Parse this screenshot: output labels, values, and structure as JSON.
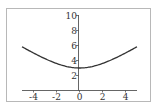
{
  "chart_data": {
    "type": "line",
    "title": "",
    "xlabel": "",
    "ylabel": "",
    "xlim": [
      -5,
      5
    ],
    "ylim": [
      0,
      10
    ],
    "grid": false,
    "legend": null,
    "x_ticks": [
      "-4",
      "-2",
      "0",
      "2",
      "4"
    ],
    "y_ticks": [
      "2",
      "4",
      "6",
      "8",
      "10"
    ],
    "series": [
      {
        "name": "curve",
        "function": "sqrt(x^2 + 9)",
        "x": [
          -5,
          -4,
          -3,
          -2,
          -1,
          0,
          1,
          2,
          3,
          4,
          5
        ],
        "values": [
          5.83,
          5.0,
          4.24,
          3.61,
          3.16,
          3.0,
          3.16,
          3.61,
          4.24,
          5.0,
          5.83
        ]
      }
    ]
  },
  "colors": {
    "frame": "#b0b0b0",
    "axis": "#555555",
    "curve": "#333333"
  }
}
